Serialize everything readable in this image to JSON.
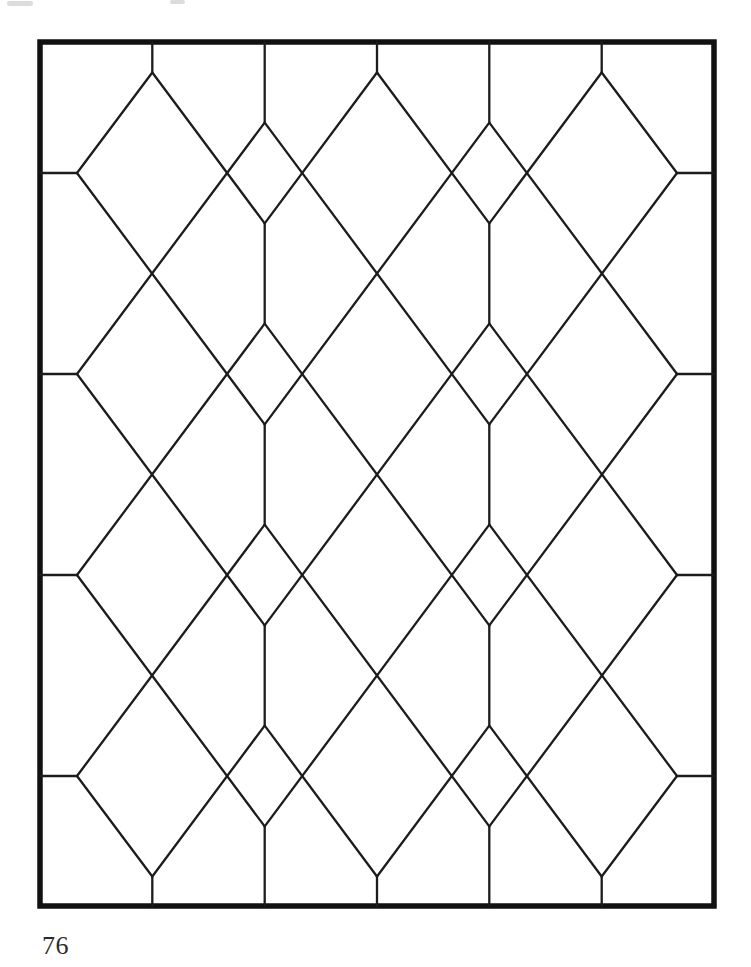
{
  "page": {
    "page_number": "76",
    "background_color": "#ffffff",
    "text_color": "#2b2b2b"
  },
  "pattern": {
    "type": "leaded-glass-diamond-lattice-window",
    "frame": {
      "x": 40,
      "y": 42,
      "width": 674,
      "height": 864,
      "stroke_width": 5.5,
      "color": "#111111"
    },
    "lines": {
      "stroke_width": 2.3,
      "color": "#1c1c1c"
    },
    "segments": [
      [
        264.7,
        42,
        264.7,
        122.6
      ],
      [
        264.7,
        223.4,
        264.7,
        323.6
      ],
      [
        264.7,
        424.4,
        264.7,
        524.6
      ],
      [
        264.7,
        625.4,
        264.7,
        725.6
      ],
      [
        264.7,
        826.4,
        264.7,
        906
      ],
      [
        489.3,
        42,
        489.3,
        122.6
      ],
      [
        489.3,
        223.4,
        489.3,
        323.6
      ],
      [
        489.3,
        424.4,
        489.3,
        524.6
      ],
      [
        489.3,
        625.4,
        489.3,
        725.6
      ],
      [
        489.3,
        826.4,
        489.3,
        906
      ],
      [
        152.3,
        42,
        152.3,
        72.5
      ],
      [
        377,
        42,
        377,
        72.5
      ],
      [
        601.7,
        42,
        601.7,
        72.5
      ],
      [
        152.3,
        876.5,
        152.3,
        906
      ],
      [
        377,
        876.5,
        377,
        906
      ],
      [
        601.7,
        876.5,
        601.7,
        906
      ],
      [
        40,
        173,
        77,
        173
      ],
      [
        40,
        374,
        77,
        374
      ],
      [
        40,
        575,
        77,
        575
      ],
      [
        40,
        776,
        77,
        776
      ],
      [
        677,
        173,
        714,
        173
      ],
      [
        677,
        374,
        714,
        374
      ],
      [
        677,
        575,
        714,
        575
      ],
      [
        677,
        776,
        714,
        776
      ],
      [
        152.3,
        72.5,
        264.7,
        223.4
      ],
      [
        377,
        72.5,
        489.3,
        223.4
      ],
      [
        601.7,
        72.5,
        677,
        173
      ],
      [
        264.7,
        122.6,
        489.3,
        424.4
      ],
      [
        489.3,
        122.6,
        677,
        374
      ],
      [
        77,
        173,
        264.7,
        424.4
      ],
      [
        264.7,
        323.6,
        489.3,
        625.4
      ],
      [
        489.3,
        323.6,
        677,
        575
      ],
      [
        77,
        374,
        264.7,
        625.4
      ],
      [
        264.7,
        524.6,
        489.3,
        826.4
      ],
      [
        489.3,
        524.6,
        677,
        776
      ],
      [
        77,
        575,
        264.7,
        826.4
      ],
      [
        264.7,
        725.6,
        377,
        876.5
      ],
      [
        489.3,
        725.6,
        601.7,
        876.5
      ],
      [
        77,
        776,
        152.3,
        876.5
      ],
      [
        601.7,
        72.5,
        489.3,
        223.4
      ],
      [
        377,
        72.5,
        264.7,
        223.4
      ],
      [
        152.3,
        72.5,
        77,
        173
      ],
      [
        489.3,
        122.6,
        264.7,
        424.4
      ],
      [
        264.7,
        122.6,
        77,
        374
      ],
      [
        677,
        173,
        489.3,
        424.4
      ],
      [
        489.3,
        323.6,
        264.7,
        625.4
      ],
      [
        264.7,
        323.6,
        77,
        575
      ],
      [
        677,
        374,
        489.3,
        625.4
      ],
      [
        489.3,
        524.6,
        264.7,
        826.4
      ],
      [
        264.7,
        524.6,
        77,
        776
      ],
      [
        677,
        575,
        489.3,
        826.4
      ],
      [
        489.3,
        725.6,
        377,
        876.5
      ],
      [
        264.7,
        725.6,
        152.3,
        876.5
      ],
      [
        677,
        776,
        601.7,
        876.5
      ]
    ],
    "scan_artifacts": {
      "color": "#bfbfbf",
      "marks": [
        [
          7,
          1,
          26,
          5
        ],
        [
          170,
          0,
          15,
          4
        ]
      ]
    }
  }
}
